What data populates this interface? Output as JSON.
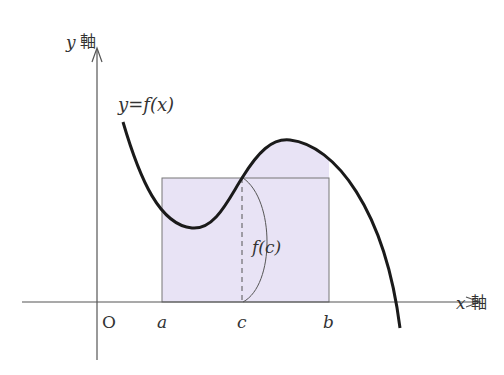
{
  "diagram": {
    "colors": {
      "fill": "#e8e3f5",
      "curve": "#1a1a1a",
      "line": "#555555"
    },
    "labels": {
      "y_axis_var": "y",
      "y_axis_kanji": "軸",
      "x_axis_var": "x",
      "x_axis_kanji": "軸",
      "origin": "O",
      "a": "a",
      "c": "c",
      "b": "b",
      "curve": "y=f(x)",
      "height": "f(c)"
    }
  }
}
